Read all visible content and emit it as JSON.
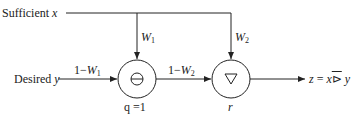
{
  "diagram": {
    "inputs": {
      "sufficient": {
        "label": "Sufficient",
        "var": "x"
      },
      "desired": {
        "label": "Desired",
        "var": "y"
      }
    },
    "weights": {
      "w1": {
        "base": "W",
        "sub": "1"
      },
      "w2": {
        "base": "W",
        "sub": "2"
      },
      "one_minus_w1": {
        "prefix": "1−",
        "base": "W",
        "sub": "1"
      },
      "one_minus_w2": {
        "prefix": "1−",
        "base": "W",
        "sub": "2"
      }
    },
    "nodes": [
      {
        "id": "node-1",
        "symbol": "⊖",
        "caption": "q =1",
        "icon": "circled-minus-icon"
      },
      {
        "id": "node-2",
        "symbol": "▽",
        "caption": "r",
        "icon": "down-triangle-icon"
      }
    ],
    "output": {
      "text": "z = x",
      "operator": "⊳̅",
      "var": "y",
      "full": "z = x ⊳̅ y"
    },
    "colors": {
      "line": "#222222",
      "background": "#ffffff"
    }
  }
}
